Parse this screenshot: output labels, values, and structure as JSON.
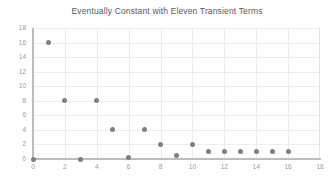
{
  "chart_data": {
    "type": "scatter",
    "title": "Eventually Constant with Eleven Transient Terms",
    "xlabel": "",
    "ylabel": "",
    "xlim": [
      0,
      18
    ],
    "ylim": [
      0,
      18
    ],
    "xticks": [
      0,
      2,
      4,
      6,
      8,
      10,
      12,
      14,
      16,
      18
    ],
    "yticks": [
      0,
      2,
      4,
      6,
      8,
      10,
      12,
      14,
      16,
      18
    ],
    "grid": true,
    "legend": null,
    "marker_color": "#7f7f7f",
    "x": [
      0,
      1,
      2,
      3,
      4,
      5,
      6,
      7,
      8,
      9,
      10,
      11,
      12,
      13,
      14,
      15,
      16
    ],
    "y": [
      0,
      16,
      8,
      0,
      8,
      4,
      0.2,
      4,
      2,
      0.5,
      2,
      1,
      1,
      1,
      1,
      1,
      1
    ]
  }
}
